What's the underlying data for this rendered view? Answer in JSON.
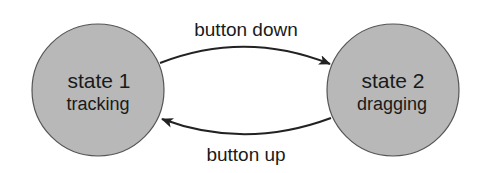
{
  "diagram": {
    "type": "state-machine",
    "colors": {
      "state_fill": "#b8b8b8",
      "stroke": "#333333",
      "text": "#1a1a1a"
    },
    "states": [
      {
        "id": "state1",
        "title": "state 1",
        "subtitle": "tracking"
      },
      {
        "id": "state2",
        "title": "state 2",
        "subtitle": "dragging"
      }
    ],
    "transitions": [
      {
        "from": "state1",
        "to": "state2",
        "label": "button down"
      },
      {
        "from": "state2",
        "to": "state1",
        "label": "button up"
      }
    ]
  }
}
